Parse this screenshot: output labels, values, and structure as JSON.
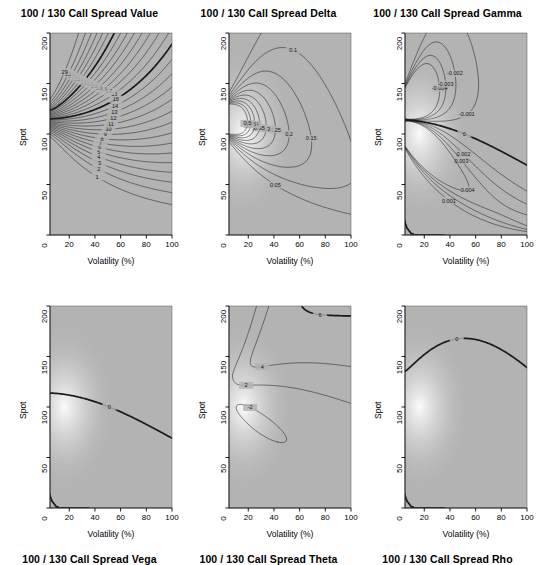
{
  "figure": {
    "width": 537,
    "height": 546,
    "background": "#ffffff",
    "panel_background": "#b3b3b3",
    "contour_color": "#1a1a1a",
    "rows": 2,
    "cols": 3
  },
  "axes": {
    "xlabel": "Volatility (%)",
    "ylabel": "Spot",
    "xticks": [
      "20",
      "40",
      "60",
      "80",
      "100"
    ],
    "xtick_values": [
      20,
      40,
      60,
      80,
      100
    ],
    "yticks": [
      "0",
      "50",
      "100",
      "150",
      "200"
    ],
    "ytick_values": [
      0,
      50,
      100,
      150,
      200
    ],
    "xlim": [
      5,
      100
    ],
    "ylim": [
      0,
      200
    ]
  },
  "panels": [
    {
      "id": "value",
      "title": "100 / 130 Call Spread Value",
      "levels": [
        1,
        2,
        3,
        4,
        5,
        6,
        7,
        8,
        9,
        10,
        11,
        12,
        13,
        14,
        15,
        16,
        17,
        18,
        19,
        20,
        21,
        22,
        23,
        24,
        25,
        26,
        27,
        28,
        29
      ],
      "labels": [
        "1",
        "2",
        "3",
        "4",
        "5",
        "6",
        "7",
        "8",
        "9",
        "10",
        "11",
        "12",
        "13",
        "14",
        "15",
        "16",
        "17",
        "18",
        "19",
        "20",
        "21",
        "22",
        "23",
        "24",
        "25",
        "26",
        "27",
        "28",
        "29"
      ],
      "heavy_levels": [
        15,
        23
      ]
    },
    {
      "id": "delta",
      "title": "100 / 130 Call Spread Delta",
      "levels": [
        0.05,
        0.1,
        0.15,
        0.2,
        0.25,
        0.3,
        0.35,
        0.4,
        0.45,
        0.5
      ],
      "labels": [
        "0.05",
        "0.1",
        "0.15",
        "0.2",
        "0.25",
        "0.3",
        "0.35",
        "0.4",
        "0.45",
        "0.5"
      ],
      "heavy_levels": []
    },
    {
      "id": "gamma",
      "title": "100 / 130 Call Spread Gamma",
      "levels": [
        -0.004,
        -0.003,
        -0.002,
        -0.001,
        0,
        0.001,
        0.002,
        0.003,
        0.004
      ],
      "labels": [
        "-0.004",
        "-0.003",
        "-0.002",
        "-0.001",
        "0",
        "0.001",
        "0.002",
        "0.003",
        "0.004"
      ],
      "heavy_levels": [
        0
      ]
    },
    {
      "id": "vega",
      "title": "100 / 130 Call Spread Vega",
      "levels": [
        -25,
        -20,
        -15,
        -10,
        -5,
        0,
        5,
        10,
        15,
        20
      ],
      "labels": [
        "-25",
        "-20",
        "-15",
        "-10",
        "-5",
        "0",
        "5",
        "10",
        "15",
        "20"
      ],
      "heavy_levels": [
        0
      ]
    },
    {
      "id": "theta",
      "title": "100 / 130 Call Spread Theta",
      "levels": [
        -48,
        -46,
        -44,
        -42,
        -40,
        -38,
        -36,
        -34,
        -32,
        -30,
        -28,
        -26,
        -24,
        -22,
        -20,
        -18,
        -16,
        -14,
        -12,
        -10,
        -8,
        -6,
        -4,
        -2,
        2,
        4,
        6,
        8,
        10,
        12,
        14,
        16,
        18
      ],
      "labels": [
        "-48",
        "-46",
        "-44",
        "-42",
        "-40",
        "-38",
        "-36",
        "-34",
        "-32",
        "-30",
        "-28",
        "-26",
        "-24",
        "-22",
        "-20",
        "-18",
        "-16",
        "-14",
        "-12",
        "-10",
        "-8",
        "-6",
        "-4",
        "-2",
        "2",
        "4",
        "6",
        "8",
        "10",
        "12",
        "14",
        "16",
        "18"
      ],
      "heavy_levels": [
        -34,
        -6,
        6
      ]
    },
    {
      "id": "rho",
      "title": "100 / 130 Call Spread Rho",
      "levels": [
        -20,
        -15,
        -10,
        -5,
        0,
        5,
        10,
        15,
        20,
        25
      ],
      "labels": [
        "-20",
        "-15",
        "-10",
        "-5",
        "0",
        "5",
        "10",
        "15",
        "20",
        "25"
      ],
      "heavy_levels": [
        0
      ]
    }
  ],
  "chart_data": {
    "type": "contour",
    "xlabel": "Volatility (%)",
    "ylabel": "Spot",
    "xlim": [
      5,
      100
    ],
    "ylim": [
      0,
      200
    ],
    "grid": false,
    "legend": "none",
    "panel_layout": "2 rows x 3 cols",
    "subplots": [
      {
        "title": "100 / 130 Call Spread Value",
        "quantity": "Value",
        "contour_levels": [
          1,
          2,
          3,
          4,
          5,
          6,
          7,
          8,
          9,
          10,
          11,
          12,
          13,
          14,
          15,
          16,
          17,
          18,
          19,
          20,
          21,
          22,
          23,
          24,
          25,
          26,
          27,
          28,
          29
        ],
        "labeled_contours": [
          "1",
          "2",
          "3",
          "4",
          "5",
          "6",
          "7",
          "8",
          "9",
          "10",
          "14",
          "15",
          "16",
          "17",
          "18",
          "19",
          "20",
          "21",
          "22",
          "23",
          "24",
          "25",
          "26",
          "27",
          "28",
          "29"
        ],
        "value_range": [
          0,
          30
        ],
        "notes": "Value increases monotonically with spot; contours fan out from the (low-vol, spot~100) singularity toward upper-right and lower-right."
      },
      {
        "title": "100 / 130 Call Spread Delta",
        "quantity": "Delta",
        "contour_levels": [
          0.05,
          0.1,
          0.15,
          0.2,
          0.25,
          0.3,
          0.35,
          0.4,
          0.45,
          0.5
        ],
        "labeled_contours": [
          "0.05",
          "0.1",
          "0.15",
          "0.2",
          "0.25",
          "0.3"
        ],
        "value_range": [
          0,
          0.55
        ],
        "notes": "Delta peaks in a hot spot near spot 100 at low volatility, decaying in nested lobes outward."
      },
      {
        "title": "100 / 130 Call Spread Gamma",
        "quantity": "Gamma",
        "contour_levels": [
          -0.004,
          -0.003,
          -0.002,
          -0.001,
          0,
          0.001,
          0.002,
          0.003,
          0.004
        ],
        "labeled_contours": [
          "-0.001",
          "-0.002",
          "-0.003",
          "0",
          "0.001",
          "0.002",
          "0.003",
          "0.004"
        ],
        "value_range": [
          -0.005,
          0.005
        ],
        "notes": "Gamma is negative above spot ~115 (short strike) and positive below spot ~95 (long strike), with a zero line running across."
      },
      {
        "title": "100 / 130 Call Spread Vega",
        "quantity": "Vega",
        "contour_levels": [
          -25,
          -20,
          -15,
          -10,
          -5,
          0,
          5,
          10,
          15,
          20
        ],
        "labeled_contours": [
          "-20",
          "-15",
          "-10",
          "-5",
          "0",
          "5",
          "10",
          "15",
          "20"
        ],
        "value_range": [
          -30,
          25
        ],
        "notes": "Negative vega lobe above spot 100, positive vega lobe below; zero contour sweeps to the lower right."
      },
      {
        "title": "100 / 130 Call Spread Theta",
        "quantity": "Theta",
        "contour_levels": [
          -48,
          -46,
          -44,
          -42,
          -40,
          -38,
          -36,
          -34,
          -32,
          -30,
          -28,
          -26,
          -24,
          -22,
          -20,
          -18,
          -16,
          -14,
          -12,
          -10,
          -8,
          -6,
          -4,
          -2,
          2,
          4,
          6,
          8,
          10,
          12,
          14,
          16,
          18
        ],
        "labeled_contours": [
          "-48",
          "-46",
          "-44",
          "-42",
          "-40",
          "-38",
          "-36",
          "-34",
          "-32",
          "-30",
          "-28",
          "-26",
          "-20",
          "-16",
          "-10",
          "-8",
          "-6",
          "2",
          "4",
          "6",
          "8",
          "10",
          "12",
          "14",
          "16",
          "18"
        ],
        "value_range": [
          -50,
          20
        ],
        "notes": "Strongly negative theta in the upper-right (high vol, high spot); positive theta lobe in the lower-middle region."
      },
      {
        "title": "100 / 130 Call Spread Rho",
        "quantity": "Rho",
        "contour_levels": [
          -20,
          -15,
          -10,
          -5,
          0,
          5,
          10,
          15,
          20,
          25
        ],
        "labeled_contours": [
          "-15",
          "-10",
          "-5",
          "0",
          "5",
          "10",
          "15",
          "20"
        ],
        "value_range": [
          -25,
          28
        ],
        "notes": "Positive rho lobe centred near spot 100 low vol, negative rho fanning to the upper left/right past the zero contour."
      }
    ]
  }
}
